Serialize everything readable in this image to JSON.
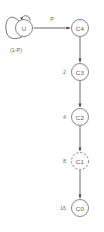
{
  "diagram": {
    "type": "state-transition-diagram",
    "title": "",
    "nodes": [
      {
        "id": "U",
        "label": "U",
        "cx": 24,
        "cy": 28,
        "r": 8.5,
        "style": "solid"
      },
      {
        "id": "C4",
        "label": "C4",
        "cx": 80,
        "cy": 28,
        "r": 8.5,
        "style": "solid"
      },
      {
        "id": "C3",
        "label": "C3",
        "cx": 80,
        "cy": 72,
        "r": 8.5,
        "style": "solid"
      },
      {
        "id": "C2",
        "label": "C2",
        "cx": 80,
        "cy": 117,
        "r": 8.5,
        "style": "solid"
      },
      {
        "id": "C1",
        "label": "C1",
        "cx": 80,
        "cy": 161,
        "r": 8.5,
        "style": "dashed"
      },
      {
        "id": "C0",
        "label": "C0",
        "cx": 80,
        "cy": 208,
        "r": 8.5,
        "style": "solid"
      }
    ],
    "edges": [
      {
        "id": "u-self",
        "from": "U",
        "to": "U",
        "label": "(1-P)",
        "kind": "self-loop"
      },
      {
        "id": "u-c4",
        "from": "U",
        "to": "C4",
        "label": "P",
        "kind": "straight-horizontal"
      },
      {
        "id": "c4-c3",
        "from": "C4",
        "to": "C3",
        "label": "",
        "kind": "straight-vertical"
      },
      {
        "id": "c3-c2",
        "from": "C3",
        "to": "C2",
        "label": "",
        "kind": "straight-vertical"
      },
      {
        "id": "c2-c1",
        "from": "C2",
        "to": "C1",
        "label": "",
        "kind": "straight-vertical"
      },
      {
        "id": "c1-c0",
        "from": "C1",
        "to": "C0",
        "label": "",
        "kind": "straight-vertical"
      }
    ],
    "side_labels": [
      {
        "id": "label-c3",
        "text": "2",
        "for": "C3",
        "x": 64,
        "y": 72
      },
      {
        "id": "label-c2",
        "text": "4",
        "for": "C2",
        "x": 64,
        "y": 117
      },
      {
        "id": "label-c1",
        "text": "8",
        "for": "C1",
        "x": 64,
        "y": 161
      },
      {
        "id": "label-c0",
        "text": "16",
        "for": "C0",
        "x": 64,
        "y": 208
      }
    ],
    "edge_labels": {
      "transition_p": "P",
      "self_loop": "(1-P)"
    },
    "colors": {
      "background": "#ffffff",
      "node_stroke": "#7a7a7a",
      "edge_stroke": "#6b6b6b",
      "text": "#5d5d5d"
    }
  }
}
